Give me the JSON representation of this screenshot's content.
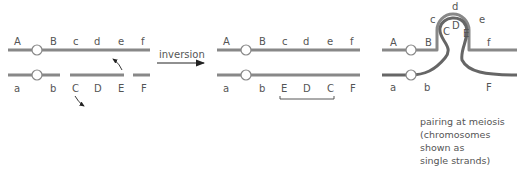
{
  "colors": {
    "chromosome": "#888888",
    "centromere_fill": "#ffffff",
    "centromere_stroke": "#888888",
    "text": "#555555",
    "arrow": "#222222"
  },
  "left_panel": {
    "top_labels": [
      "A",
      "B",
      "c",
      "d",
      "e",
      "f"
    ],
    "bottom_labels": [
      "a",
      "b",
      "C",
      "D",
      "E",
      "F"
    ]
  },
  "arrow": {
    "label": "inversion"
  },
  "middle_panel": {
    "top_labels": [
      "A",
      "B",
      "c",
      "d",
      "e",
      "f"
    ],
    "bottom_labels": [
      "a",
      "b",
      "E",
      "D",
      "C",
      "F"
    ]
  },
  "right_panel": {
    "top_labels": [
      "A",
      "B",
      "c",
      "d",
      "e",
      "f"
    ],
    "bottom_labels": [
      "a",
      "b",
      "C",
      "D",
      "E",
      "F"
    ],
    "caption": [
      "pairing at meiosis",
      "(chromosomes",
      "shown as",
      "single strands)"
    ]
  }
}
